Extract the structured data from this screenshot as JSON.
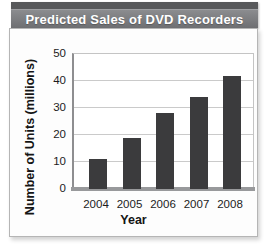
{
  "title_banner": {
    "title": "Predicted Sales of DVD Recorders"
  },
  "chart_data": {
    "type": "bar",
    "title": "Predicted Sales of DVD Recorders",
    "categories": [
      "2004",
      "2005",
      "2006",
      "2007",
      "2008"
    ],
    "values": [
      11,
      19,
      28,
      34,
      42
    ],
    "xlabel": "Year",
    "ylabel": "Number of Units (millions)",
    "ylim": [
      0,
      50
    ],
    "yticks": [
      0,
      10,
      20,
      30,
      40,
      50
    ],
    "grid": true,
    "legend": "none",
    "bar_color": "#3b3b3d"
  },
  "colors": {
    "banner_top_strip": "#58595b",
    "banner_body_top": "#8b8c8f",
    "banner_body_bottom": "#6e6f72",
    "banner_text": "#ffffff",
    "panel_background": "#fdfdfd",
    "panel_border": "#b5b5b5",
    "gridline": "#cacaca",
    "axis_line": "#8e8e90",
    "baseline": "#98999b",
    "bar": "#3b3b3d",
    "tick_text": "#1c1c1c"
  }
}
